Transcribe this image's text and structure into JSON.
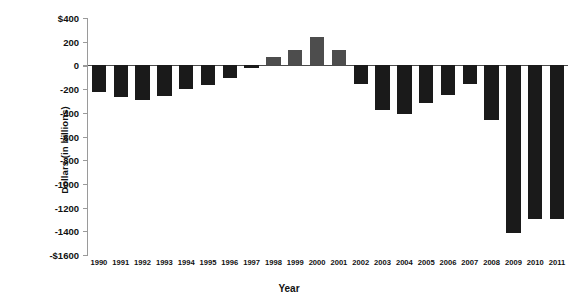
{
  "chart_data": {
    "type": "bar",
    "title": "",
    "xlabel": "Year",
    "ylabel": "Dollars (in billions)",
    "ylim": [
      -1600,
      400
    ],
    "grid": false,
    "legend": null,
    "ytick_labels": [
      "$400",
      "200",
      "0",
      "-200",
      "-400",
      "-600",
      "-800",
      "-1000",
      "-1200",
      "-1400",
      "-$1600"
    ],
    "ytick_values": [
      400,
      200,
      0,
      -200,
      -400,
      -600,
      -800,
      -1000,
      -1200,
      -1400,
      -1600
    ],
    "categories": [
      "1990",
      "1991",
      "1992",
      "1993",
      "1994",
      "1995",
      "1996",
      "1997",
      "1998",
      "1999",
      "2000",
      "2001",
      "2002",
      "2003",
      "2004",
      "2005",
      "2006",
      "2007",
      "2008",
      "2009",
      "2010",
      "2011"
    ],
    "values": [
      -221,
      -269,
      -290,
      -255,
      -203,
      -164,
      -107,
      -22,
      69,
      126,
      236,
      128,
      -158,
      -378,
      -413,
      -318,
      -248,
      -161,
      -459,
      -1413,
      -1294,
      -1300
    ],
    "colors": {
      "negative_bar": "#1a1a1a",
      "positive_bar": "#4d4d4d",
      "axis": "#9a9a9a",
      "zero_line": "#4a4a4a",
      "text": "#111111",
      "background": "#ffffff"
    }
  }
}
